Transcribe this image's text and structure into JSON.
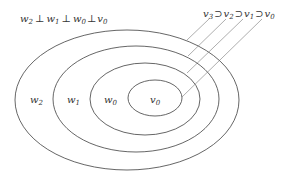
{
  "diagram": {
    "top_left_relation": {
      "items": [
        {
          "base": "w",
          "sub": "2"
        },
        {
          "base": "w",
          "sub": "1"
        },
        {
          "base": "w",
          "sub": "0"
        },
        {
          "base": "v",
          "sub": "0"
        }
      ],
      "operator": "⊥"
    },
    "top_right_relation": {
      "items": [
        {
          "base": "v",
          "sub": "3"
        },
        {
          "base": "v",
          "sub": "2"
        },
        {
          "base": "v",
          "sub": "1"
        },
        {
          "base": "v",
          "sub": "0"
        }
      ],
      "operator": "⊃"
    },
    "regions": [
      {
        "base": "w",
        "sub": "2"
      },
      {
        "base": "w",
        "sub": "1"
      },
      {
        "base": "w",
        "sub": "0"
      },
      {
        "base": "v",
        "sub": "0"
      }
    ],
    "line_color": "#555555"
  }
}
